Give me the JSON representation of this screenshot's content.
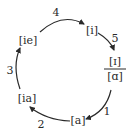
{
  "diagram": {
    "type": "cycle",
    "nodes": [
      {
        "id": "i",
        "label": "[i]"
      },
      {
        "id": "fraction",
        "numerator": "[ɪ]",
        "denominator": "[ɑ]"
      },
      {
        "id": "a",
        "label": "[a]"
      },
      {
        "id": "ia",
        "label": "[ia]"
      },
      {
        "id": "ie",
        "label": "[ie]"
      }
    ],
    "edges": [
      {
        "from": "fraction",
        "to": "a",
        "label": "1"
      },
      {
        "from": "a",
        "to": "ia",
        "label": "2"
      },
      {
        "from": "ia",
        "to": "ie",
        "label": "3"
      },
      {
        "from": "ie",
        "to": "i",
        "label": "4"
      },
      {
        "from": "i",
        "to": "fraction",
        "label": "5"
      }
    ],
    "colors": {
      "ink": "#2a2a2a",
      "background": "#ffffff"
    }
  }
}
